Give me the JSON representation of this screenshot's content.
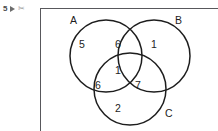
{
  "marker": {
    "number": "5",
    "arrow_icon": "play-triangle-icon",
    "trailing_icon": "scissors-icon"
  },
  "diagram": {
    "type": "venn-3-set",
    "set_labels": {
      "a": "A",
      "b": "B",
      "c": "C"
    },
    "regions": [
      {
        "key": "a",
        "label": "A only",
        "value": "5"
      },
      {
        "key": "ab",
        "label": "A and B only",
        "value": "6"
      },
      {
        "key": "b",
        "label": "B only",
        "value": "1"
      },
      {
        "key": "abc",
        "label": "A and B and C",
        "value": "1"
      },
      {
        "key": "ac",
        "label": "A and C only",
        "value": "6"
      },
      {
        "key": "bc",
        "label": "B and C only",
        "value": "7"
      },
      {
        "key": "c",
        "label": "C only",
        "value": "2"
      }
    ],
    "stroke_color": "#1d1d1d",
    "background_color": "#ffffff"
  },
  "frame": {
    "rule_color": "#58585c"
  }
}
